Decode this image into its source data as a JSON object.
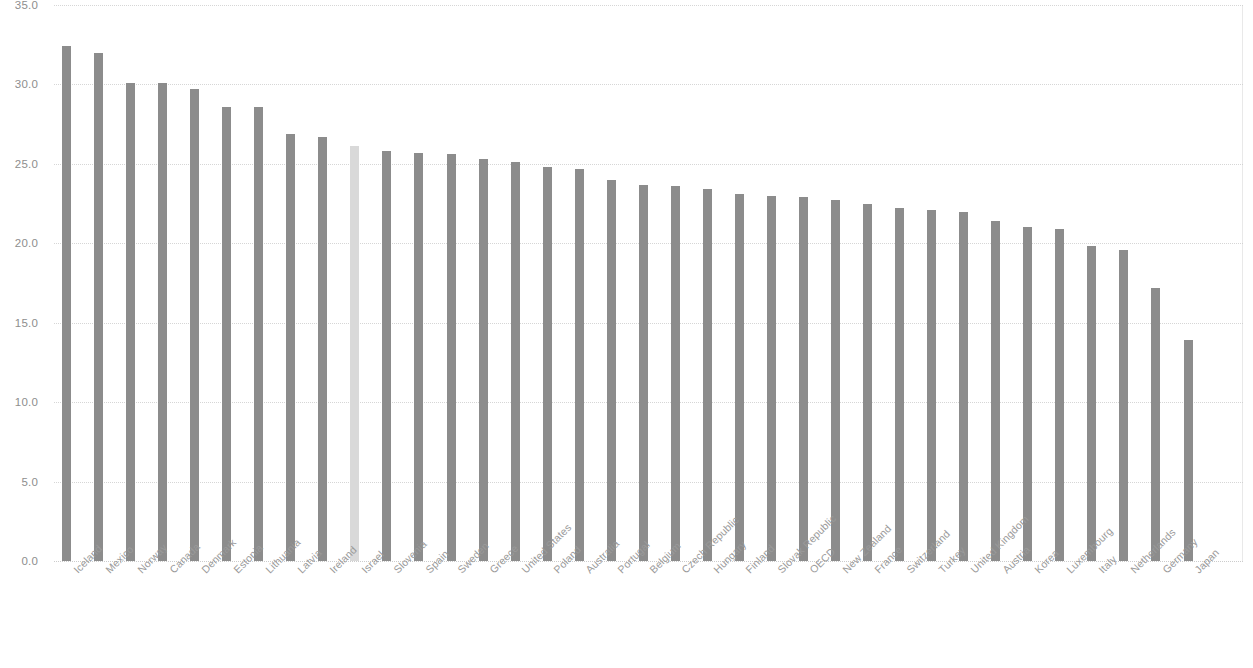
{
  "chart_data": {
    "type": "bar",
    "title": "",
    "subtitle": "",
    "xlabel": "",
    "ylabel": "",
    "ylim": [
      0.0,
      35.0
    ],
    "ytick_labels": [
      "35.0",
      "30.0",
      "25.0",
      "20.0",
      "15.0",
      "10.0",
      "5.0",
      "0.0"
    ],
    "ytick_values": [
      35.0,
      30.0,
      25.0,
      20.0,
      15.0,
      10.0,
      5.0,
      0.0
    ],
    "grid": true,
    "legend": "none",
    "highlight_category": "Israel",
    "colors": {
      "bar": "#8c8c8c",
      "bar_highlight": "#d9d9d9",
      "gridline": "#cfcfcf",
      "tick_text": "#8e8e8e",
      "category_text": "#9a9a9a",
      "background": "#ffffff",
      "plot_border": "#e9e9e9"
    },
    "categories": [
      "Iceland",
      "Mexico",
      "Norway",
      "Canada",
      "Denmark",
      "Estonia",
      "Lithuania",
      "Latvia",
      "Ireland",
      "Israel",
      "Slovenia",
      "Spain",
      "Sweden",
      "Greece",
      "United States",
      "Poland",
      "Australia",
      "Portugal",
      "Belgium",
      "Czech Republic",
      "Hungary",
      "Finland",
      "Slovak Republic",
      "OECD",
      "New Zealand",
      "France",
      "Switzerland",
      "Turkey",
      "United Kingdom",
      "Austria",
      "Korea",
      "Luxembourg",
      "Italy",
      "Netherlands",
      "Germany",
      "Japan"
    ],
    "values": [
      32.4,
      32.0,
      30.1,
      30.1,
      29.7,
      28.6,
      28.6,
      26.9,
      26.7,
      26.1,
      25.8,
      25.7,
      25.6,
      25.3,
      25.1,
      24.8,
      24.7,
      24.0,
      23.7,
      23.6,
      23.4,
      23.1,
      23.0,
      22.9,
      22.7,
      22.5,
      22.2,
      22.1,
      22.0,
      21.4,
      21.0,
      20.9,
      19.8,
      19.6,
      17.2,
      13.9
    ]
  }
}
